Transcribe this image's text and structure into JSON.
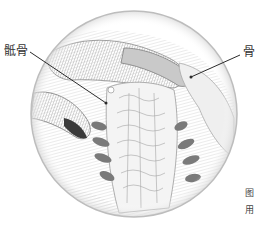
{
  "figure": {
    "type": "anatomical-illustration",
    "labels": {
      "left": "骶骨",
      "right": "骨"
    },
    "caption": {
      "line1": "图",
      "line2": "用"
    },
    "colors": {
      "circle_edge": "#bdbdbd",
      "vertebra_process": "#7a7a7a",
      "line": "#2b2b2b",
      "sketch": "#9a9a9a"
    }
  }
}
